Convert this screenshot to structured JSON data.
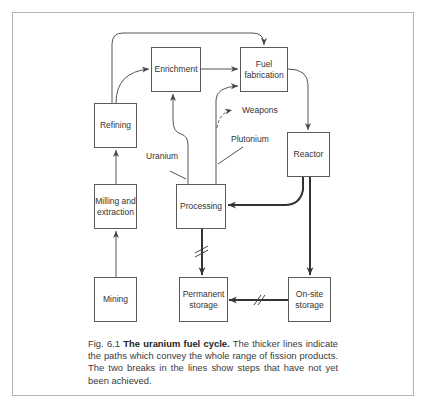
{
  "figure": {
    "nodes": {
      "mining": "Mining",
      "milling": "Milling and extraction",
      "refining": "Refining",
      "enrichment": "Enrichment",
      "fuel_fabrication": "Fuel fabrication",
      "reactor": "Reactor",
      "processing": "Processing",
      "onsite_storage": "On-site storage",
      "permanent_storage": "Permanent storage"
    },
    "edge_labels": {
      "uranium": "Uranium",
      "plutonium": "Plutonium",
      "weapons": "Weapons"
    },
    "caption": {
      "prefix": "Fig. 6.1",
      "title": "The uranium fuel cycle.",
      "body": "The thicker lines indicate the paths which convey the whole range of fission products. The two breaks in the lines show steps that have not yet been achieved."
    }
  }
}
